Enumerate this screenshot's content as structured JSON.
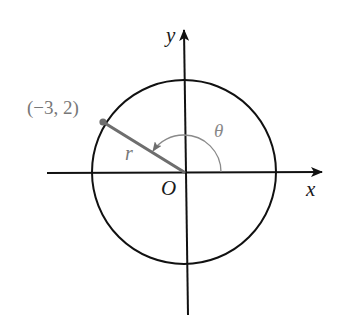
{
  "diagram": {
    "type": "polar-coordinate-figure",
    "axes": {
      "x_label": "x",
      "y_label": "y",
      "origin_label": "O"
    },
    "circle": {
      "center": "O",
      "description": "circle of radius r centered at origin"
    },
    "point": {
      "label": "(−3, 2)",
      "x": -3,
      "y": 2
    },
    "radius_label": "r",
    "angle_label": "θ",
    "colors": {
      "axes": "#111111",
      "circle": "#111111",
      "radius_segment": "#6e6e6e",
      "angle_arc": "#8a8a8a",
      "point_label": "#777777"
    }
  }
}
